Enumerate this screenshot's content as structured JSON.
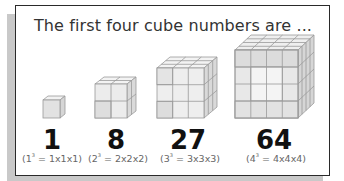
{
  "title": "The first four cube numbers are ...",
  "items": [
    {
      "value": "1",
      "base": "1",
      "exp": "3",
      "expansion": "1x1x1",
      "side": 1
    },
    {
      "value": "8",
      "base": "2",
      "exp": "3",
      "expansion": "2x2x2",
      "side": 2
    },
    {
      "value": "27",
      "base": "3",
      "exp": "3",
      "expansion": "3x3x3",
      "side": 3
    },
    {
      "value": "64",
      "base": "4",
      "exp": "3",
      "expansion": "4x4x4",
      "side": 4
    }
  ],
  "colors": {
    "frame": "#2a2a2a",
    "shadow": "#c9c9c9",
    "cube_front": "#e6e6e6",
    "cube_top": "#f2f2f2",
    "cube_side": "#d6d6d6",
    "cube_edge": "#9a9a9a"
  }
}
